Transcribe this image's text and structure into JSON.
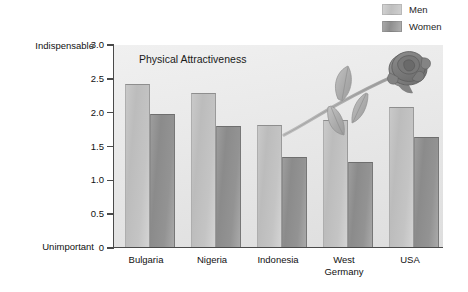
{
  "legend": {
    "position": "top-right",
    "items": [
      {
        "label": "Men",
        "key": "men",
        "color": "#c6c6c6"
      },
      {
        "label": "Women",
        "key": "women",
        "color": "#939393"
      }
    ]
  },
  "axis": {
    "top_anchor_label": "Indispensable",
    "bottom_anchor_label": "Unimportant",
    "ticks": [
      "3.0",
      "2.5",
      "2.0",
      "1.5",
      "1.0",
      "0.5",
      "0"
    ]
  },
  "decoration": {
    "rose_icon": "rose-illustration",
    "rose_petal_color": "#8b8b8b",
    "rose_leaf_color": "#b3b3b3",
    "rose_stem_color": "#a9a9a9"
  },
  "chart_data": {
    "type": "bar",
    "title": "Physical Attractiveness",
    "xlabel": "",
    "ylabel": "",
    "ylim": [
      0,
      3.0
    ],
    "ytick_values": [
      3.0,
      2.5,
      2.0,
      1.5,
      1.0,
      0.5,
      0
    ],
    "ytick_labels": [
      "3.0",
      "2.5",
      "2.0",
      "1.5",
      "1.0",
      "0.5",
      "0"
    ],
    "y_axis_low_label": "Unimportant",
    "y_axis_high_label": "Indispensable",
    "grid": false,
    "legend_position": "top-right",
    "categories": [
      "Bulgaria",
      "Nigeria",
      "Indonesia",
      "West\nGermany",
      "USA"
    ],
    "category_labels_flat": [
      "Bulgaria",
      "Nigeria",
      "Indonesia",
      "West Germany",
      "USA"
    ],
    "series": [
      {
        "name": "Men",
        "values": [
          2.41,
          2.28,
          1.81,
          1.87,
          2.07
        ]
      },
      {
        "name": "Women",
        "values": [
          1.96,
          1.79,
          1.33,
          1.26,
          1.62
        ]
      }
    ]
  }
}
